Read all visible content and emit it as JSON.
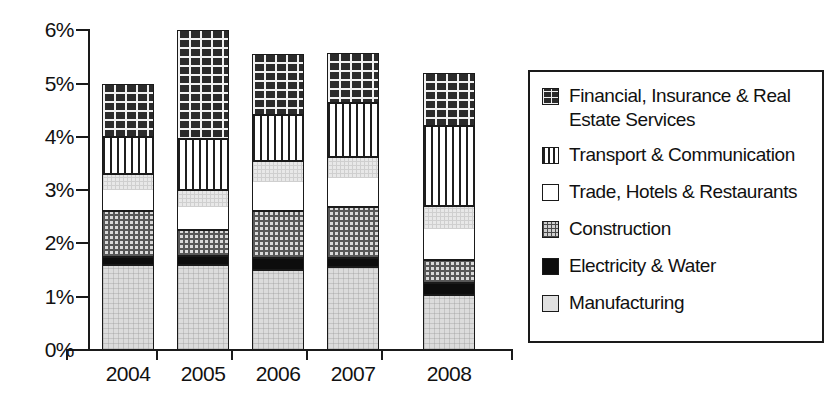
{
  "chart_data": {
    "type": "bar",
    "subtype": "stacked-bar",
    "title": "",
    "xlabel": "",
    "ylabel": "",
    "categories": [
      "2004",
      "2005",
      "2006",
      "2007",
      "2008"
    ],
    "ylim": [
      0,
      6
    ],
    "ytick_values": [
      0,
      1,
      2,
      3,
      4,
      5,
      6
    ],
    "ytick_labels": [
      "0%",
      "1%",
      "2%",
      "3%",
      "4%",
      "5%",
      "6%"
    ],
    "yaxis_unit": "percent",
    "grid": false,
    "legend_position": "right",
    "stack_order_bottom_to_top": [
      "Manufacturing",
      "Electricity & Water",
      "Construction",
      "Trade, Hotels & Restaurants",
      "Transport & Communication",
      "Financial, Insurance & Real Estate Services"
    ],
    "series": [
      {
        "name": "Manufacturing",
        "pattern": "light-grey-solid",
        "values": [
          1.6,
          1.6,
          1.5,
          1.55,
          1.03
        ]
      },
      {
        "name": "Electricity & Water",
        "pattern": "black-solid",
        "values": [
          0.15,
          0.17,
          0.23,
          0.18,
          0.22
        ]
      },
      {
        "name": "Construction",
        "pattern": "checkerboard",
        "values": [
          0.85,
          0.48,
          0.87,
          0.95,
          0.44
        ]
      },
      {
        "name": "Trade, Hotels & Restaurants",
        "pattern": "white",
        "values": [
          0.7,
          0.75,
          0.95,
          0.95,
          1.01
        ]
      },
      {
        "name": "Transport & Communication",
        "pattern": "vertical-stripes",
        "values": [
          0.7,
          0.95,
          0.85,
          1.0,
          1.5
        ]
      },
      {
        "name": "Financial, Insurance & Real Estate Services",
        "pattern": "brick",
        "values": [
          1.0,
          2.05,
          1.15,
          0.95,
          1.0
        ]
      }
    ],
    "totals": [
      5.0,
      6.0,
      5.55,
      5.6,
      5.2
    ]
  },
  "legend": {
    "items": [
      {
        "label": "Financial, Insurance & Real\nEstate Services",
        "pattern": "brick"
      },
      {
        "label": "Transport & Communication",
        "pattern": "vertical-stripes"
      },
      {
        "label": "Trade, Hotels & Restaurants",
        "pattern": "white"
      },
      {
        "label": "Construction",
        "pattern": "checkerboard"
      },
      {
        "label": "Electricity & Water",
        "pattern": "black-solid"
      },
      {
        "label": "Manufacturing",
        "pattern": "light-grey-solid"
      }
    ]
  },
  "colors": {
    "axis": "#1a1a1a",
    "text": "#111111",
    "background": "#ffffff",
    "manufacturing": "#dcdcdc",
    "electricity_water": "#0d0d0d",
    "construction": "#d9d9d9",
    "trade_hotels": "#ffffff",
    "transport": "#ffffff",
    "financial": "#2b2b2b"
  }
}
